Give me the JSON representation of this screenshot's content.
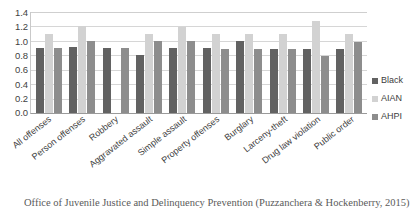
{
  "chart_data": {
    "type": "bar",
    "title": "",
    "subtitle": "",
    "xlabel": "",
    "ylabel": "",
    "ylim": [
      0.0,
      1.4
    ],
    "ytick_step": 0.2,
    "yticks": [
      "1.4",
      "1.2",
      "1.0",
      "0.8",
      "0.6",
      "0.4",
      "0.2",
      "0.0"
    ],
    "grid": true,
    "grid_axis": "y",
    "legend_position": "right",
    "categories": [
      "All offenses",
      "Person offenses",
      "Robbery",
      "Aggravated assault",
      "Simple assault",
      "Property offenses",
      "Burglary",
      "Larceny-theft",
      "Drug law violation",
      "Public order"
    ],
    "series": [
      {
        "name": "Black",
        "color": "#626262",
        "values": [
          0.9,
          0.91,
          0.9,
          0.8,
          0.9,
          0.9,
          1.0,
          0.89,
          0.89,
          0.89
        ]
      },
      {
        "name": "AIAN",
        "color": "#d2d2d2",
        "values": [
          1.1,
          1.21,
          null,
          1.1,
          1.19,
          1.1,
          1.1,
          1.09,
          1.28,
          1.09
        ]
      },
      {
        "name": "AHPI",
        "color": "#8d8d8d",
        "values": [
          0.9,
          1.0,
          0.9,
          1.0,
          1.0,
          0.89,
          0.89,
          0.89,
          0.79,
          0.99
        ]
      }
    ]
  },
  "legend": {
    "items": [
      {
        "label": "Black"
      },
      {
        "label": "AIAN"
      },
      {
        "label": "AHPI"
      }
    ]
  },
  "caption": {
    "text": "Office of Juvenile Justice and Delinquency Prevention (Puzzanchera & Hockenberry, 2015)"
  }
}
